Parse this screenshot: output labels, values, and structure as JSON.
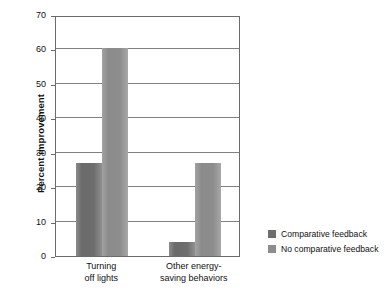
{
  "chart_data": {
    "type": "bar",
    "title": "",
    "subtitle": "",
    "xlabel": "",
    "ylabel": "Percent improvement",
    "ylim": [
      0,
      70
    ],
    "yticks": [
      0,
      10,
      20,
      30,
      40,
      50,
      60,
      70
    ],
    "ytick_labels": [
      "0",
      "10",
      "20",
      "30",
      "40",
      "50",
      "60",
      "70"
    ],
    "grid": true,
    "legend_position": "right",
    "categories": [
      "Turning off lights",
      "Other energy-saving behaviors"
    ],
    "category_lines": [
      [
        "Turning",
        "off lights"
      ],
      [
        "Other energy-",
        "saving behaviors"
      ]
    ],
    "series": [
      {
        "name": "Comparative feedback",
        "color": "#6e6e6e",
        "values": [
          27,
          4
        ]
      },
      {
        "name": "No comparative feedback",
        "color": "#8d8d8d",
        "values": [
          60.5,
          27
        ]
      }
    ]
  },
  "legend": {
    "items": [
      {
        "label": "Comparative feedback"
      },
      {
        "label": "No comparative feedback"
      }
    ]
  },
  "axes": {
    "y_title": "Percent improvement"
  }
}
